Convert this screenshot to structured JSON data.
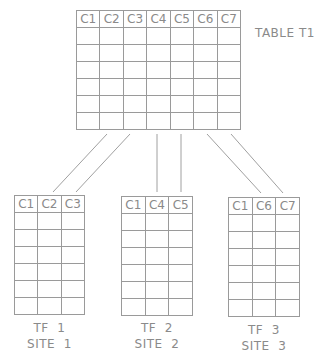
{
  "main_table": {
    "label": "TABLE T1",
    "columns": [
      "C1",
      "C2",
      "C3",
      "C4",
      "C5",
      "C6",
      "C7"
    ],
    "body_rows": 6
  },
  "fragments": [
    {
      "columns": [
        "C1",
        "C2",
        "C3"
      ],
      "body_rows": 6,
      "label_line1": "TF  1",
      "label_line2": "SITE  1"
    },
    {
      "columns": [
        "C1",
        "C4",
        "C5"
      ],
      "body_rows": 6,
      "label_line1": "TF  2",
      "label_line2": "SITE  2"
    },
    {
      "columns": [
        "C1",
        "C6",
        "C7"
      ],
      "body_rows": 6,
      "label_line1": "TF  3",
      "label_line2": "SITE  3"
    }
  ],
  "colors": {
    "line": "#9a9a9a",
    "text": "#8a8a8a",
    "background": "#ffffff"
  }
}
